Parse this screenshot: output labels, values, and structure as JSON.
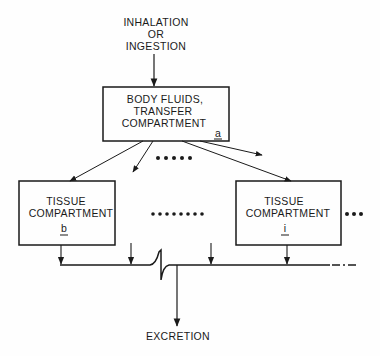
{
  "diagram": {
    "input": {
      "lines": [
        "INHALATION",
        "OR",
        "INGESTION"
      ]
    },
    "transfer_compartment": {
      "lines": [
        "BODY FLUIDS,",
        "TRANSFER",
        "COMPARTMENT"
      ],
      "id": "a"
    },
    "tissue_compartments": [
      {
        "lines": [
          "TISSUE",
          "COMPARTMENT"
        ],
        "id": "b"
      },
      {
        "lines": [
          "TISSUE",
          "COMPARTMENT"
        ],
        "id": "i"
      }
    ],
    "output": {
      "label": "EXCRETION"
    },
    "colors": {
      "ink": "#1a1a1a",
      "background": "#fefefe"
    }
  }
}
